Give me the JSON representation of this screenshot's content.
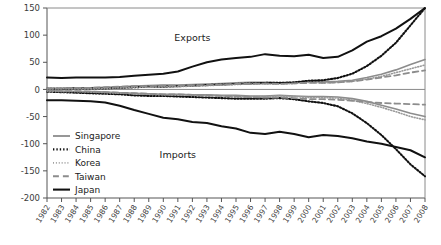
{
  "chart_data": {
    "type": "line",
    "title": "",
    "xlabel": "",
    "ylabel": "",
    "ylim": [
      -200,
      150
    ],
    "ytick_values": [
      150,
      100,
      50,
      0,
      -50,
      -100,
      -150,
      -200
    ],
    "grid": false,
    "legend_position": "left-lower",
    "annotations": [
      {
        "text": "Exports",
        "x": 1992,
        "y": 95
      },
      {
        "text": "Imports",
        "x": 1991,
        "y": -120
      }
    ],
    "x": [
      1982,
      1983,
      1984,
      1985,
      1986,
      1987,
      1988,
      1989,
      1990,
      1991,
      1992,
      1993,
      1994,
      1995,
      1996,
      1997,
      1998,
      1999,
      2000,
      2001,
      2002,
      2003,
      2004,
      2005,
      2006,
      2007,
      2008
    ],
    "xtick_labels": [
      "1982",
      "1983",
      "1984",
      "1985",
      "1986",
      "1987",
      "1988",
      "1989",
      "1990",
      "1991",
      "1992",
      "1993",
      "1994",
      "1995",
      "1996",
      "1997",
      "1998",
      "1999",
      "2000",
      "2001",
      "2002",
      "2003",
      "2004",
      "2005",
      "2006",
      "2007",
      "2008"
    ],
    "series": [
      {
        "name": "Singapore",
        "group": "Exports",
        "color": "#8c8c8c",
        "style": "solid",
        "width": 1.6,
        "values": [
          2,
          2,
          3,
          3,
          4,
          5,
          6,
          7,
          8,
          8,
          9,
          10,
          11,
          12,
          13,
          13,
          12,
          13,
          15,
          14,
          15,
          17,
          22,
          28,
          36,
          46,
          55
        ]
      },
      {
        "name": "Singapore",
        "group": "Imports",
        "color": "#8c8c8c",
        "style": "solid",
        "width": 1.6,
        "values": [
          -3,
          -3,
          -4,
          -4,
          -5,
          -6,
          -7,
          -8,
          -9,
          -9,
          -10,
          -10,
          -11,
          -11,
          -12,
          -12,
          -11,
          -12,
          -13,
          -13,
          -14,
          -17,
          -22,
          -29,
          -36,
          -44,
          -50
        ]
      },
      {
        "name": "China",
        "group": "Exports",
        "color": "#111111",
        "style": "dotted-bold",
        "width": 2.1,
        "values": [
          1,
          1,
          2,
          2,
          2,
          3,
          4,
          5,
          5,
          6,
          7,
          8,
          9,
          10,
          11,
          12,
          12,
          13,
          16,
          17,
          21,
          29,
          43,
          62,
          86,
          118,
          150
        ]
      },
      {
        "name": "China",
        "group": "Imports",
        "color": "#111111",
        "style": "dotted-bold",
        "width": 2.1,
        "values": [
          -4,
          -5,
          -6,
          -7,
          -8,
          -9,
          -11,
          -12,
          -12,
          -13,
          -14,
          -15,
          -16,
          -17,
          -17,
          -17,
          -16,
          -18,
          -22,
          -25,
          -31,
          -44,
          -62,
          -84,
          -110,
          -138,
          -160
        ]
      },
      {
        "name": "Korea",
        "group": "Exports",
        "color": "#9a9a9a",
        "style": "dotted-fine",
        "width": 1.6,
        "values": [
          1,
          1,
          2,
          2,
          2,
          3,
          4,
          4,
          5,
          5,
          6,
          7,
          8,
          9,
          10,
          10,
          10,
          11,
          13,
          12,
          13,
          15,
          19,
          24,
          31,
          38,
          45
        ]
      },
      {
        "name": "Korea",
        "group": "Imports",
        "color": "#9a9a9a",
        "style": "dotted-fine",
        "width": 1.6,
        "values": [
          -3,
          -4,
          -4,
          -5,
          -6,
          -7,
          -8,
          -9,
          -10,
          -10,
          -11,
          -11,
          -12,
          -13,
          -13,
          -13,
          -12,
          -13,
          -15,
          -15,
          -16,
          -20,
          -26,
          -33,
          -41,
          -50,
          -56
        ]
      },
      {
        "name": "Taiwan",
        "group": "Exports",
        "color": "#8c8c8c",
        "style": "dashed",
        "width": 1.8,
        "values": [
          2,
          2,
          3,
          3,
          4,
          5,
          6,
          6,
          7,
          7,
          8,
          8,
          9,
          10,
          10,
          11,
          10,
          11,
          12,
          12,
          13,
          15,
          18,
          22,
          26,
          31,
          35
        ]
      },
      {
        "name": "Taiwan",
        "group": "Imports",
        "color": "#8c8c8c",
        "style": "dashed",
        "width": 1.8,
        "values": [
          -2,
          -3,
          -3,
          -4,
          -5,
          -6,
          -7,
          -8,
          -9,
          -9,
          -10,
          -11,
          -12,
          -13,
          -14,
          -15,
          -15,
          -16,
          -18,
          -18,
          -19,
          -21,
          -23,
          -25,
          -26,
          -27,
          -28
        ]
      },
      {
        "name": "Japan",
        "group": "Exports",
        "color": "#111111",
        "style": "solid",
        "width": 2.0,
        "values": [
          22,
          21,
          22,
          22,
          22,
          23,
          25,
          27,
          29,
          33,
          42,
          50,
          55,
          58,
          60,
          65,
          62,
          61,
          64,
          58,
          60,
          72,
          88,
          98,
          112,
          130,
          150
        ]
      },
      {
        "name": "Japan",
        "group": "Imports",
        "color": "#111111",
        "style": "solid",
        "width": 2.0,
        "values": [
          -20,
          -20,
          -21,
          -22,
          -24,
          -30,
          -38,
          -45,
          -52,
          -55,
          -60,
          -62,
          -68,
          -72,
          -80,
          -82,
          -78,
          -82,
          -88,
          -84,
          -86,
          -90,
          -96,
          -100,
          -106,
          -112,
          -125
        ]
      }
    ],
    "legend": [
      {
        "label": "Singapore",
        "style": "solid",
        "color": "#8c8c8c",
        "width": 1.8
      },
      {
        "label": "China",
        "style": "dotted-bold",
        "color": "#111111",
        "width": 2.2
      },
      {
        "label": "Korea",
        "style": "dotted-fine",
        "color": "#9a9a9a",
        "width": 1.7
      },
      {
        "label": "Taiwan",
        "style": "dashed",
        "color": "#8c8c8c",
        "width": 1.9
      },
      {
        "label": "Japan",
        "style": "solid",
        "color": "#111111",
        "width": 2.1
      }
    ]
  }
}
